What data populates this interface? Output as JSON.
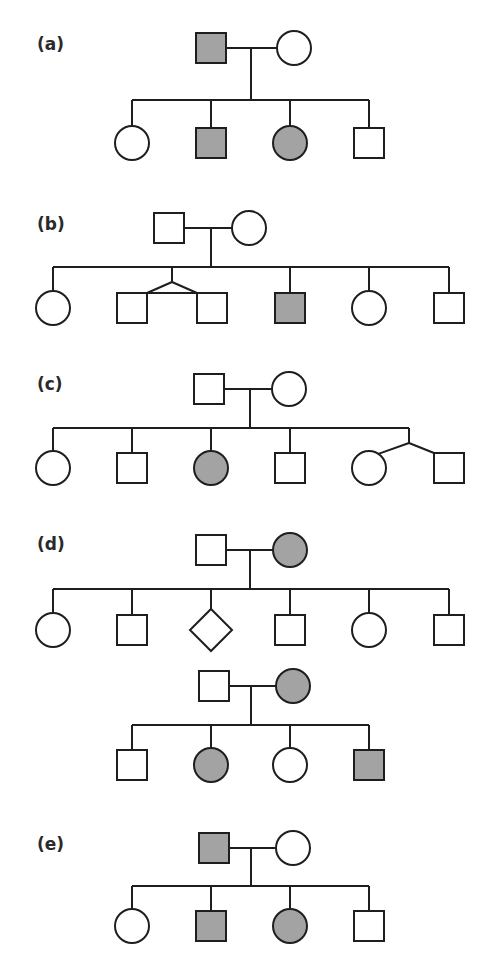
{
  "figure": {
    "colors": {
      "affected": "#a3a3a3",
      "unaffected": "#ffffff",
      "line": "#1e1e1e",
      "label": "#2a2a2a"
    },
    "panels": [
      {
        "label": "(a)",
        "label_pos": [
          37,
          50
        ],
        "pedigrees": [
          {
            "parents": [
              {
                "sex": "male",
                "affected": true,
                "cx": 211,
                "cy": 48
              },
              {
                "sex": "female",
                "affected": false,
                "cx": 294,
                "cy": 48
              }
            ],
            "mating_y": 48,
            "drop_x": 251,
            "sibship_y": 100,
            "children": [
              {
                "sex": "female",
                "affected": false,
                "cx": 132,
                "cy": 143
              },
              {
                "sex": "male",
                "affected": true,
                "cx": 211,
                "cy": 143
              },
              {
                "sex": "female",
                "affected": true,
                "cx": 290,
                "cy": 143
              },
              {
                "sex": "male",
                "affected": false,
                "cx": 369,
                "cy": 143
              }
            ]
          }
        ]
      },
      {
        "label": "(b)",
        "label_pos": [
          37,
          230
        ],
        "pedigrees": [
          {
            "parents": [
              {
                "sex": "male",
                "affected": false,
                "cx": 169,
                "cy": 228
              },
              {
                "sex": "female",
                "affected": false,
                "cx": 249,
                "cy": 228
              }
            ],
            "mating_y": 228,
            "drop_x": 211,
            "sibship_y": 267,
            "children": [
              {
                "sex": "female",
                "affected": false,
                "cx": 53,
                "cy": 308
              },
              {
                "sex": "male",
                "affected": false,
                "cx": 132,
                "cy": 308,
                "twin": "identical"
              },
              {
                "sex": "male",
                "affected": false,
                "cx": 212,
                "cy": 308,
                "twin": "identical"
              },
              {
                "sex": "male",
                "affected": true,
                "cx": 290,
                "cy": 308
              },
              {
                "sex": "female",
                "affected": false,
                "cx": 369,
                "cy": 308
              },
              {
                "sex": "male",
                "affected": false,
                "cx": 449,
                "cy": 308
              }
            ]
          }
        ]
      },
      {
        "label": "(c)",
        "label_pos": [
          37,
          390
        ],
        "pedigrees": [
          {
            "parents": [
              {
                "sex": "male",
                "affected": false,
                "cx": 209,
                "cy": 389
              },
              {
                "sex": "female",
                "affected": false,
                "cx": 289,
                "cy": 389
              }
            ],
            "mating_y": 389,
            "drop_x": 250,
            "sibship_y": 428,
            "children": [
              {
                "sex": "female",
                "affected": false,
                "cx": 53,
                "cy": 468
              },
              {
                "sex": "male",
                "affected": false,
                "cx": 132,
                "cy": 468
              },
              {
                "sex": "female",
                "affected": true,
                "cx": 211,
                "cy": 468
              },
              {
                "sex": "male",
                "affected": false,
                "cx": 290,
                "cy": 468
              },
              {
                "sex": "female",
                "affected": false,
                "cx": 369,
                "cy": 468,
                "twin": "fraternal"
              },
              {
                "sex": "male",
                "affected": false,
                "cx": 449,
                "cy": 468,
                "twin": "fraternal"
              }
            ]
          }
        ]
      },
      {
        "label": "(d)",
        "label_pos": [
          37,
          550
        ],
        "pedigrees": [
          {
            "parents": [
              {
                "sex": "male",
                "affected": false,
                "cx": 211,
                "cy": 550
              },
              {
                "sex": "female",
                "affected": true,
                "cx": 290,
                "cy": 550
              }
            ],
            "mating_y": 550,
            "drop_x": 250,
            "sibship_y": 589,
            "children": [
              {
                "sex": "female",
                "affected": false,
                "cx": 53,
                "cy": 630
              },
              {
                "sex": "male",
                "affected": false,
                "cx": 132,
                "cy": 630
              },
              {
                "sex": "unknown",
                "affected": false,
                "cx": 211,
                "cy": 630
              },
              {
                "sex": "male",
                "affected": false,
                "cx": 290,
                "cy": 630
              },
              {
                "sex": "female",
                "affected": false,
                "cx": 369,
                "cy": 630
              },
              {
                "sex": "male",
                "affected": false,
                "cx": 449,
                "cy": 630
              }
            ]
          },
          {
            "parents": [
              {
                "sex": "male",
                "affected": false,
                "cx": 214,
                "cy": 686
              },
              {
                "sex": "female",
                "affected": true,
                "cx": 293,
                "cy": 686
              }
            ],
            "mating_y": 686,
            "drop_x": 251,
            "sibship_y": 725,
            "children": [
              {
                "sex": "male",
                "affected": false,
                "cx": 132,
                "cy": 765
              },
              {
                "sex": "female",
                "affected": true,
                "cx": 211,
                "cy": 765
              },
              {
                "sex": "female",
                "affected": false,
                "cx": 290,
                "cy": 765
              },
              {
                "sex": "male",
                "affected": true,
                "cx": 369,
                "cy": 765
              }
            ]
          }
        ]
      },
      {
        "label": "(e)",
        "label_pos": [
          37,
          850
        ],
        "pedigrees": [
          {
            "parents": [
              {
                "sex": "male",
                "affected": true,
                "cx": 214,
                "cy": 848
              },
              {
                "sex": "female",
                "affected": false,
                "cx": 293,
                "cy": 848
              }
            ],
            "mating_y": 848,
            "drop_x": 251,
            "sibship_y": 886,
            "children": [
              {
                "sex": "female",
                "affected": false,
                "cx": 132,
                "cy": 926
              },
              {
                "sex": "male",
                "affected": true,
                "cx": 211,
                "cy": 926
              },
              {
                "sex": "female",
                "affected": true,
                "cx": 290,
                "cy": 926
              },
              {
                "sex": "male",
                "affected": false,
                "cx": 369,
                "cy": 926
              }
            ]
          }
        ]
      }
    ]
  }
}
